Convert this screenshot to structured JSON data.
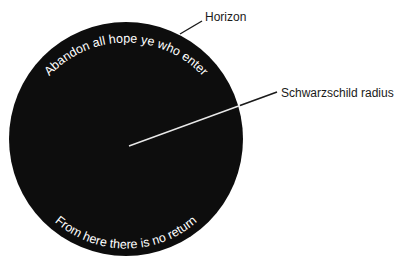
{
  "diagram": {
    "colors": {
      "background": "#ffffff",
      "black_hole": "#0d0d0d",
      "radius_line": "#e8e8e8",
      "leader_line": "#1a1a1a",
      "label_text": "#1a1a1a",
      "arc_text": "#ffffff"
    },
    "circle": {
      "cx": 126,
      "cy": 139,
      "r": 117
    },
    "labels": {
      "horizon": "Horizon",
      "schwarzschild_radius": "Schwarzschild radius"
    },
    "arc_text": {
      "top": "Abandon all  hope ye who enter",
      "bottom": "From here there is no return"
    }
  }
}
